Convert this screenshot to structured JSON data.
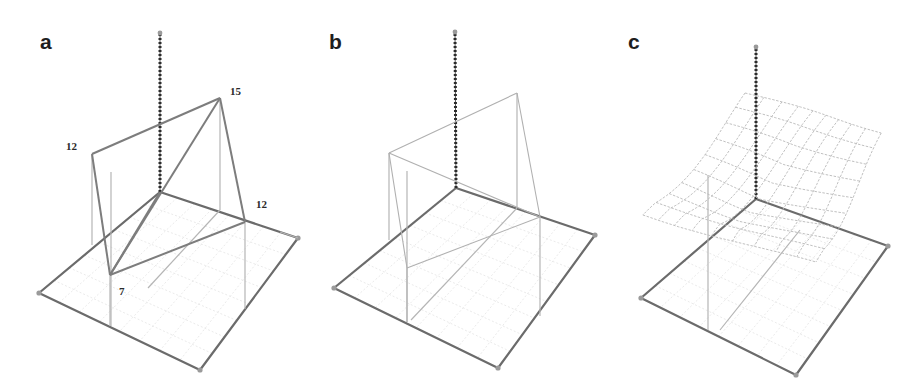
{
  "figure": {
    "colors": {
      "axis": "#2b2b2b",
      "floor_edge": "#6b6b6b",
      "surface_a": "#7d7d7d",
      "surface_b": "#b0b0b0",
      "mesh": "#b9b9b9",
      "grid": "#e4e4e4"
    }
  },
  "panels": [
    {
      "id": "a",
      "label": "a",
      "label_pos": [
        40,
        49
      ],
      "axis": {
        "base": [
          160,
          192
        ],
        "top": [
          160,
          33
        ]
      },
      "floor": {
        "back": [
          160,
          192
        ],
        "left": [
          39,
          293
        ],
        "front": [
          200,
          370
        ],
        "right": [
          298,
          238
        ]
      },
      "points": [
        {
          "name": "left",
          "value": "12",
          "pos": [
            92,
            154
          ],
          "floor": [
            92,
            245
          ],
          "label_pos": [
            66,
            150
          ]
        },
        {
          "name": "back",
          "value": "15",
          "pos": [
            220,
            98
          ],
          "floor": [
            220,
            210
          ],
          "label_pos": [
            230,
            95
          ]
        },
        {
          "name": "right",
          "value": "12",
          "pos": [
            245,
            222
          ],
          "floor": [
            245,
            309
          ],
          "label_pos": [
            256,
            208
          ]
        },
        {
          "name": "front",
          "value": "7",
          "pos": [
            110,
            275
          ],
          "floor": [
            110,
            326
          ],
          "label_pos": [
            119,
            295
          ]
        }
      ],
      "extra_lines": [
        [
          [
            111,
            172
          ],
          [
            111,
            326
          ]
        ],
        [
          [
            220,
            210
          ],
          [
            148,
            288
          ]
        ],
        [
          [
            280,
            232
          ],
          [
            298,
            238
          ]
        ]
      ]
    },
    {
      "id": "b",
      "label": "b",
      "label_pos": [
        329,
        49
      ],
      "axis": {
        "base": [
          456,
          188
        ],
        "top": [
          455,
          32
        ]
      },
      "floor": {
        "back": [
          456,
          188
        ],
        "left": [
          334,
          288
        ],
        "front": [
          498,
          368
        ],
        "right": [
          595,
          235
        ]
      },
      "points": [
        {
          "name": "left",
          "value": "",
          "pos": [
            389,
            153
          ],
          "floor": [
            389,
            240
          ]
        },
        {
          "name": "back",
          "value": "",
          "pos": [
            517,
            93
          ],
          "floor": [
            517,
            208
          ]
        },
        {
          "name": "right",
          "value": "",
          "pos": [
            540,
            217
          ],
          "floor": [
            540,
            316
          ]
        },
        {
          "name": "front",
          "value": "",
          "pos": [
            407,
            268
          ],
          "floor": [
            407,
            322
          ]
        }
      ],
      "extra_lines": [
        [
          [
            407,
            171
          ],
          [
            407,
            322
          ]
        ],
        [
          [
            517,
            208
          ],
          [
            411,
            320
          ]
        ]
      ]
    },
    {
      "id": "c",
      "label": "c",
      "label_pos": [
        628,
        49
      ],
      "axis": {
        "base": [
          756,
          199
        ],
        "top": [
          756,
          47
        ]
      },
      "floor": {
        "back": [
          756,
          199
        ],
        "left": [
          641,
          298
        ],
        "front": [
          796,
          375
        ],
        "right": [
          888,
          246
        ]
      },
      "mesh": {
        "rows": 9,
        "cols": 9,
        "back_left": [
          745,
          93
        ],
        "back_right": [
          887,
          133
        ],
        "front_left": [
          642,
          215
        ],
        "front_right": [
          810,
          262
        ],
        "sag": 32
      },
      "extra_lines": [
        [
          [
            708,
            175
          ],
          [
            708,
            330
          ]
        ],
        [
          [
            720,
            330
          ],
          [
            800,
            230
          ]
        ]
      ]
    }
  ]
}
